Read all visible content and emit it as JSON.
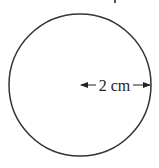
{
  "diagram": {
    "shape": "circle",
    "radius_label": "2 cm",
    "radius_value": 2,
    "radius_unit": "cm",
    "stroke_color": "#333333",
    "background": "#ffffff"
  }
}
